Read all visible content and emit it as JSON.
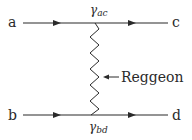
{
  "diagram": {
    "colors": {
      "line": "#2a2a2a",
      "background": "#ffffff"
    },
    "particles": {
      "a": "a",
      "b": "b",
      "c": "c",
      "d": "d"
    },
    "couplings": {
      "top": {
        "symbol": "γ",
        "sub": "ac"
      },
      "bottom": {
        "symbol": "γ",
        "sub": "bd"
      }
    },
    "exchange": {
      "label": "Reggeon",
      "arrow": "←"
    },
    "lines": [
      {
        "name": "upper-line",
        "from": "a",
        "to": "c",
        "arrows": 2
      },
      {
        "name": "lower-line",
        "from": "b",
        "to": "d",
        "arrows": 2
      }
    ]
  }
}
